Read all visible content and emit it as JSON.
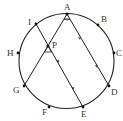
{
  "diagram": {
    "type": "circle-geometry",
    "circle": {
      "cx": 66.5,
      "cy": 61,
      "r": 47.5
    },
    "points": [
      {
        "name": "A",
        "x": 67,
        "y": 14,
        "lx": 64,
        "ly": 10
      },
      {
        "name": "B",
        "x": 98,
        "y": 25,
        "lx": 101,
        "ly": 22
      },
      {
        "name": "C",
        "x": 114,
        "y": 53,
        "lx": 116,
        "ly": 56
      },
      {
        "name": "D",
        "x": 109,
        "y": 86,
        "lx": 111,
        "ly": 95
      },
      {
        "name": "E",
        "x": 83,
        "y": 107,
        "lx": 81,
        "ly": 117
      },
      {
        "name": "F",
        "x": 49,
        "y": 107,
        "lx": 42,
        "ly": 115
      },
      {
        "name": "G",
        "x": 24,
        "y": 86,
        "lx": 13,
        "ly": 93
      },
      {
        "name": "H",
        "x": 18,
        "y": 53,
        "lx": 7,
        "ly": 56
      },
      {
        "name": "I",
        "x": 36,
        "y": 24,
        "lx": 28,
        "ly": 25
      },
      {
        "name": "P",
        "x": 48,
        "y": 46,
        "lx": 52,
        "ly": 48
      }
    ],
    "segments": [
      {
        "from": "A",
        "to": "G"
      },
      {
        "from": "A",
        "to": "D"
      },
      {
        "from": "I",
        "to": "E"
      }
    ],
    "parallel_marks": [
      "AD",
      "IE"
    ],
    "angle_marks": [
      "angle at A between AG and AD",
      "angle at P between PG and PE"
    ],
    "colors": {
      "stroke": "#222222",
      "label": "#333333",
      "background": "#ffffff"
    }
  }
}
